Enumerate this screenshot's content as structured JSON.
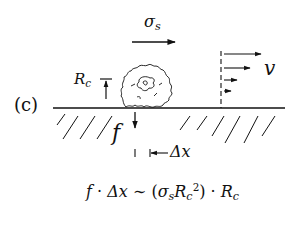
{
  "panel_label": "(c)",
  "labels": {
    "shear_stress": {
      "base": "σ",
      "sub": "s"
    },
    "radius": {
      "base": "R",
      "sub": "c"
    },
    "velocity": "v",
    "force": "f",
    "displacement": "Δx"
  },
  "equation": {
    "lhs_f": "f",
    "dot": "·",
    "lhs_dx": "Δx",
    "sim": "∼",
    "open": "(",
    "sigma": "σ",
    "sigma_sub": "s",
    "R": "R",
    "R_sub": "c",
    "R_sup": "2",
    "close": ")",
    "dot2": "·",
    "R2": "R",
    "R2_sub": "c"
  },
  "colors": {
    "ink": "#111111",
    "background": "#ffffff"
  }
}
